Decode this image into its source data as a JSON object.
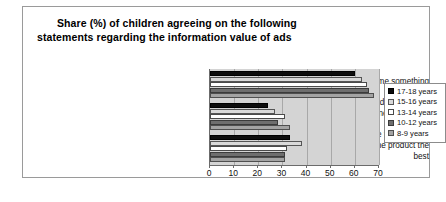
{
  "chart_data": {
    "type": "bar",
    "orientation": "horizontal",
    "title": "Share (%) of children agreeing on the following statements regarding the information value of ads",
    "title_line1": "Share (%) of children agreeing on the following",
    "title_line2": "statements regarding the information value of ads",
    "xlabel": "",
    "ylabel": "",
    "xlim": [
      0,
      70
    ],
    "xticks": [
      0,
      10,
      20,
      30,
      40,
      50,
      60,
      70
    ],
    "grid": true,
    "legend_position": "right",
    "categories": [
      "I like it when the ad tells me something new and unexpected",
      "The best ads are the ones that show which people use the products",
      "I like ads that emphasize the product the best"
    ],
    "category_lines": [
      [
        "I like it when the ad tells me something new",
        "and unexpected"
      ],
      [
        "The best ads are the ones that show which",
        "people use the products"
      ],
      [
        "I like ads that emphasize the product the",
        "best"
      ]
    ],
    "series": [
      {
        "name": "17-18 years",
        "swatch": "black",
        "color": "#0d0d0d",
        "values": [
          60,
          24,
          33
        ]
      },
      {
        "name": "15-16 years",
        "swatch": "ltgray",
        "color": "#d9d9d9",
        "values": [
          63,
          27,
          38
        ]
      },
      {
        "name": "13-14 years",
        "swatch": "white",
        "color": "#ffffff",
        "values": [
          65,
          31,
          32
        ]
      },
      {
        "name": "10-12 years",
        "swatch": "dkgray",
        "color": "#6e6e6e",
        "values": [
          66,
          28,
          31
        ]
      },
      {
        "name": "8-9 years",
        "swatch": "mdgray",
        "color": "#a3a3a3",
        "values": [
          68,
          33,
          31
        ]
      }
    ]
  },
  "legend": {
    "items": [
      {
        "label": "17-18 years",
        "swatch": "black"
      },
      {
        "label": "15-16 years",
        "swatch": "ltgray"
      },
      {
        "label": "13-14 years",
        "swatch": "white"
      },
      {
        "label": "10-12 years",
        "swatch": "dkgray"
      },
      {
        "label": "8-9 years",
        "swatch": "mdgray"
      }
    ]
  },
  "axis": {
    "tick_labels": [
      "0",
      "10",
      "20",
      "30",
      "40",
      "50",
      "60",
      "70"
    ]
  },
  "colors": {
    "plot_background": "#d4d4d4",
    "frame_border": "#9a9a9a",
    "gridline": "#a8a8a8",
    "axis_line": "#6b6b6b"
  }
}
